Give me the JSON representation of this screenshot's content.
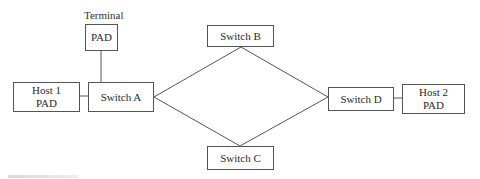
{
  "diagram": {
    "terminal_label": "Terminal",
    "nodes": {
      "terminal_pad": {
        "line1": "PAD"
      },
      "host1_pad": {
        "line1": "Host 1",
        "line2": "PAD"
      },
      "switch_a": {
        "line1": "Switch A"
      },
      "switch_b": {
        "line1": "Switch B"
      },
      "switch_c": {
        "line1": "Switch C"
      },
      "switch_d": {
        "line1": "Switch D"
      },
      "host2_pad": {
        "line1": "Host 2",
        "line2": "PAD"
      }
    },
    "edges": [
      [
        "terminal_pad",
        "switch_a"
      ],
      [
        "host1_pad",
        "switch_a"
      ],
      [
        "switch_a",
        "switch_b"
      ],
      [
        "switch_a",
        "switch_c"
      ],
      [
        "switch_b",
        "switch_d"
      ],
      [
        "switch_c",
        "switch_d"
      ],
      [
        "switch_d",
        "host2_pad"
      ]
    ],
    "colors": {
      "line": "#555555",
      "text": "#2a2a2a",
      "background": "#ffffff"
    }
  }
}
